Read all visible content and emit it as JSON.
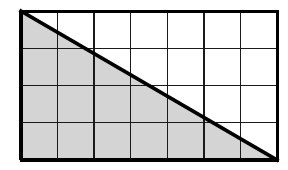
{
  "figure": {
    "canvas": {
      "width": 288,
      "height": 170,
      "background": "#ffffff"
    },
    "grid": {
      "x": 21,
      "y": 11,
      "width": 256,
      "height": 149,
      "columns": 7,
      "rows": 4,
      "total_cells": 28,
      "column_edges_x": [
        21,
        57.57,
        94.14,
        130.71,
        167.29,
        203.86,
        240.43,
        277
      ],
      "row_edges_y": [
        11,
        48.25,
        85.5,
        122.75,
        160
      ],
      "border_color": "#000000",
      "border_width": 3,
      "gridline_color": "#1a1a1a",
      "gridline_width": 1.4
    },
    "triangle": {
      "label": "shaded-triangle",
      "vertices": [
        {
          "name": "top-left",
          "x": 21,
          "y": 11
        },
        {
          "name": "bottom-left",
          "x": 21,
          "y": 160
        },
        {
          "name": "bottom-right",
          "x": 277,
          "y": 160
        }
      ],
      "fill_color": "#d4d4d4",
      "stroke_color": "#000000",
      "hypotenuse_width": 3.6,
      "shaded_cells": 14,
      "fraction_shaded": "1/2"
    }
  }
}
